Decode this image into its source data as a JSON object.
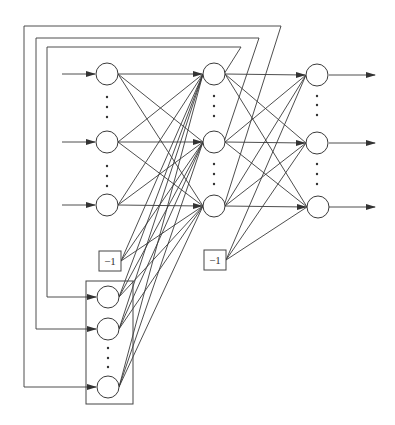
{
  "diagram": {
    "type": "recurrent-neural-network (Elman)",
    "bias_label": "−1",
    "layers": {
      "input": {
        "nodes": [
          {
            "x": 107,
            "y": 74
          },
          {
            "x": 107,
            "y": 142
          },
          {
            "x": 107,
            "y": 205
          }
        ],
        "ellipsis_between": [
          [
            1,
            2
          ],
          [
            2,
            3
          ]
        ]
      },
      "hidden": {
        "nodes": [
          {
            "x": 214,
            "y": 74
          },
          {
            "x": 214,
            "y": 142
          },
          {
            "x": 214,
            "y": 206
          }
        ],
        "ellipsis_between": [
          [
            1,
            2
          ],
          [
            2,
            3
          ]
        ]
      },
      "output": {
        "nodes": [
          {
            "x": 317,
            "y": 75
          },
          {
            "x": 317,
            "y": 143
          },
          {
            "x": 318,
            "y": 207
          }
        ],
        "ellipsis_between": [
          [
            1,
            2
          ],
          [
            2,
            3
          ]
        ]
      },
      "context": {
        "nodes": [
          {
            "x": 108,
            "y": 297
          },
          {
            "x": 108,
            "y": 329
          },
          {
            "x": 108,
            "y": 387
          }
        ],
        "ellipsis_between": [
          [
            2,
            3
          ]
        ],
        "box": {
          "x": 86,
          "y": 281,
          "w": 47,
          "h": 123
        }
      }
    },
    "bias_units": [
      {
        "label": "−1",
        "x": 99,
        "y": 251,
        "w": 22,
        "h": 20,
        "feeds": "hidden"
      },
      {
        "label": "−1",
        "x": 204,
        "y": 250,
        "w": 22,
        "h": 20,
        "feeds": "output"
      }
    ],
    "feedback_loops": [
      {
        "from_hidden": 1,
        "to_context": 1,
        "left_x": 47,
        "top_y": 47,
        "corner_x": 241
      },
      {
        "from_hidden": 2,
        "to_context": 2,
        "left_x": 36,
        "top_y": 38,
        "corner_x": 259
      },
      {
        "from_hidden": 3,
        "to_context": 3,
        "left_x": 24,
        "top_y": 26,
        "corner_x": 281
      }
    ]
  }
}
